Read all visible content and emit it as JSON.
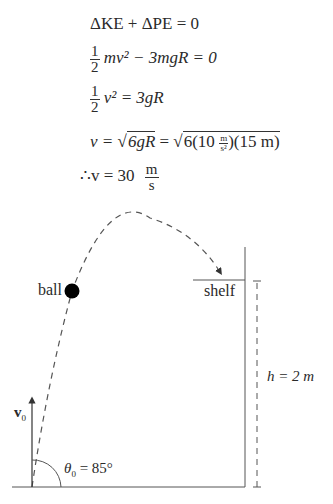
{
  "equations": {
    "line1": "ΔKE + ΔPE = 0",
    "line2_coef_num": "1",
    "line2_coef_den": "2",
    "line2_rest": "mv² − 3mgR = 0",
    "line3_coef_num": "1",
    "line3_coef_den": "2",
    "line3_rest": "v² = 3gR",
    "line4_lhs": "v = ",
    "line4_sqrt1": "6gR",
    "line4_eq": " = ",
    "line4_sqrt2_a": "6(10 ",
    "line4_unit_num": "m",
    "line4_unit_den": "s²",
    "line4_sqrt2_b": ")(15 m)",
    "line5_lhs": "∴v = 30",
    "line5_unit_num": "m",
    "line5_unit_den": "s"
  },
  "diagram": {
    "ball_label": "ball",
    "shelf_label": "shelf",
    "height_label": "h = 2 m",
    "velocity_label": "v",
    "velocity_subscript": "0",
    "angle_label": "θ",
    "angle_subscript": "0",
    "angle_value": " = 85°"
  }
}
